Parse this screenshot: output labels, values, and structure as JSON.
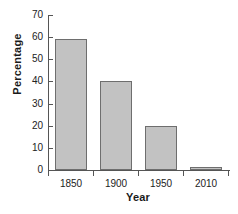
{
  "chart_data": {
    "type": "bar",
    "title": "",
    "xlabel": "Year",
    "ylabel": "Percentage",
    "categories": [
      "1850",
      "1900",
      "1950",
      "2010"
    ],
    "values": [
      59,
      40,
      20,
      1
    ],
    "ylim": [
      0,
      70
    ],
    "yticks": [
      0,
      10,
      20,
      30,
      40,
      50,
      60,
      70
    ],
    "ytick_labels": [
      "0",
      "10",
      "20",
      "30",
      "40",
      "50",
      "60",
      "70"
    ],
    "grid": false,
    "legend": false,
    "bar_color": "#c2c2c2",
    "bar_edge_color": "#6e6e6e",
    "axis_color": "#555555",
    "background": "#ffffff"
  }
}
